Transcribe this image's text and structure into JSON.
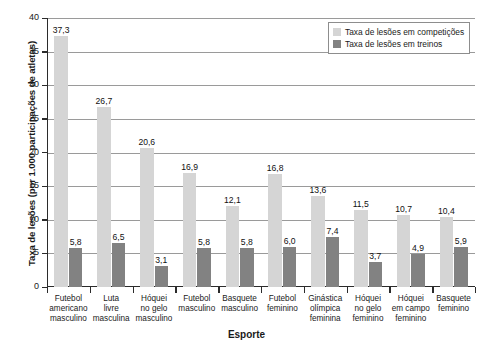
{
  "chart_data": {
    "type": "bar",
    "title": "",
    "xlabel": "Esporte",
    "ylabel": "Taxa de lesões (por 1.000 participações de atletas)",
    "ylim": [
      0,
      40
    ],
    "ytick_step": 5,
    "yticks": [
      "40",
      "35",
      "30",
      "25",
      "20",
      "15",
      "10",
      "5",
      "0"
    ],
    "grid": true,
    "legend_position": "top-right",
    "decimal_separator": ",",
    "categories": [
      "Futebol americano masculino",
      "Luta livre masculina",
      "Hóquei no gelo masculino",
      "Futebol masculino",
      "Basquete masculino",
      "Futebol feminino",
      "Ginástica olímpica feminina",
      "Hóquei no gelo feminino",
      "Hóquei em campo feminino",
      "Basquete feminino"
    ],
    "category_lines": [
      [
        "Futebol",
        "americano",
        "masculino"
      ],
      [
        "Luta",
        "livre",
        "masculina"
      ],
      [
        "Hóquei",
        "no gelo",
        "masculino"
      ],
      [
        "Futebol",
        "masculino"
      ],
      [
        "Basquete",
        "masculino"
      ],
      [
        "Futebol",
        "feminino"
      ],
      [
        "Ginástica",
        "olímpica",
        "feminina"
      ],
      [
        "Hóquei",
        "no gelo",
        "feminino"
      ],
      [
        "Hóquei",
        "em campo",
        "feminino"
      ],
      [
        "Basquete",
        "feminino"
      ]
    ],
    "series": [
      {
        "name": "Taxa de lesões em competições",
        "color": "#d5d5d5",
        "values": [
          37.3,
          26.7,
          20.6,
          16.9,
          12.1,
          16.8,
          13.6,
          11.5,
          10.7,
          10.4
        ],
        "labels": [
          "37,3",
          "26,7",
          "20,6",
          "16,9",
          "12,1",
          "16,8",
          "13,6",
          "11,5",
          "10,7",
          "10,4"
        ]
      },
      {
        "name": "Taxa de lesões em treinos",
        "color": "#828282",
        "values": [
          5.8,
          6.5,
          3.1,
          5.8,
          5.8,
          6.0,
          7.4,
          3.7,
          4.9,
          5.9
        ],
        "labels": [
          "5,8",
          "6,5",
          "3,1",
          "5,8",
          "5,8",
          "6,0",
          "7,4",
          "3,7",
          "4,9",
          "5,9"
        ]
      }
    ]
  }
}
